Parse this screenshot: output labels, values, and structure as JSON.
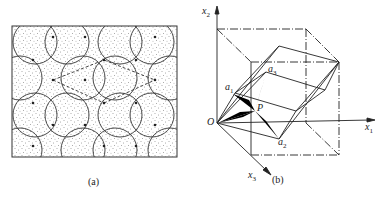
{
  "figure": {
    "panels": [
      {
        "id": "a",
        "caption": "(a)",
        "description": "Stippled tiling with overlapping circular arcs forming lens shapes; dashed lines connect lattice nodes"
      },
      {
        "id": "b",
        "caption": "(b)",
        "description": "Cube in 3D coordinates with an inscribed rhombohedron and a three-bladed star at point P",
        "axes": {
          "x1": "x",
          "x1_sub": "1",
          "x2": "x",
          "x2_sub": "2",
          "x3": "x",
          "x3_sub": "3"
        },
        "points": {
          "origin": "O",
          "p": "P",
          "a1": "a",
          "a1_sub": "1",
          "a2": "a",
          "a2_sub": "2",
          "a3": "a",
          "a3_sub": "3"
        }
      }
    ]
  },
  "colors": {
    "line": "#222222",
    "stipple": "#555555",
    "fill": "#000000",
    "background": "#ffffff"
  }
}
